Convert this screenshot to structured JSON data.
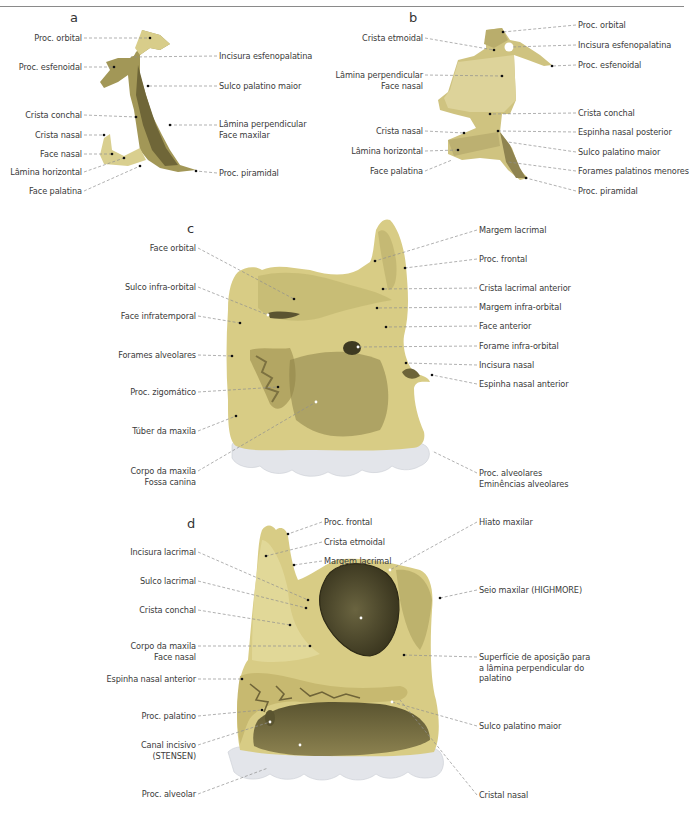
{
  "colors": {
    "bone_light": "#e6dc9a",
    "bone_mid": "#cfc27a",
    "bone_dark": "#8a7f45",
    "cavity": "#4f4a2e",
    "teeth": "#e4e6ea",
    "leader": "#8f8f8f",
    "text": "#3b3b3b"
  },
  "figures": [
    {
      "letter": "a",
      "labels_left": [
        {
          "text": "Proc. orbital",
          "x": 82,
          "y": 33
        },
        {
          "text": "Proc. esfenoidal",
          "x": 82,
          "y": 62
        },
        {
          "text": "Crista conchal",
          "x": 82,
          "y": 110
        },
        {
          "text": "Crista nasal",
          "x": 82,
          "y": 130
        },
        {
          "text": "Face nasal",
          "x": 82,
          "y": 149
        },
        {
          "text": "Lâmina horizontal",
          "x": 82,
          "y": 167
        },
        {
          "text": "Face palatina",
          "x": 82,
          "y": 186
        }
      ],
      "labels_right": [
        {
          "text": "Incisura esfenopalatina",
          "x": 219,
          "y": 51
        },
        {
          "text": "Sulco palatino maior",
          "x": 219,
          "y": 81
        },
        {
          "text": "Lâmina perpendicular\nFace maxilar",
          "x": 219,
          "y": 119
        },
        {
          "text": "Proc. piramidal",
          "x": 219,
          "y": 168
        }
      ]
    },
    {
      "letter": "b",
      "labels_left": [
        {
          "text": "Crista etmoidal",
          "x": 423,
          "y": 33
        },
        {
          "text": "Lâmina perpendicular\nFace nasal",
          "x": 423,
          "y": 70
        },
        {
          "text": "Crista nasal",
          "x": 423,
          "y": 126
        },
        {
          "text": "Lâmina horizontal",
          "x": 423,
          "y": 146
        },
        {
          "text": "Face palatina",
          "x": 423,
          "y": 166
        }
      ],
      "labels_right": [
        {
          "text": "Proc. orbital",
          "x": 578,
          "y": 20
        },
        {
          "text": "Incisura esfenopalatina",
          "x": 578,
          "y": 40
        },
        {
          "text": "Proc. esfenoidal",
          "x": 578,
          "y": 60
        },
        {
          "text": "Crista conchal",
          "x": 578,
          "y": 108
        },
        {
          "text": "Espinha nasal posterior",
          "x": 578,
          "y": 127
        },
        {
          "text": "Sulco palatino maior",
          "x": 578,
          "y": 147
        },
        {
          "text": "Forames palatinos menores",
          "x": 578,
          "y": 166
        },
        {
          "text": "Proc. piramidal",
          "x": 578,
          "y": 186
        }
      ]
    },
    {
      "letter": "c",
      "labels_left": [
        {
          "text": "Face orbital",
          "x": 196,
          "y": 243
        },
        {
          "text": "Sulco infra-orbital",
          "x": 196,
          "y": 282
        },
        {
          "text": "Face infratemporal",
          "x": 196,
          "y": 311
        },
        {
          "text": "Forames alveolares",
          "x": 196,
          "y": 350
        },
        {
          "text": "Proc. zigomático",
          "x": 196,
          "y": 387
        },
        {
          "text": "Túber da maxila",
          "x": 196,
          "y": 426
        },
        {
          "text": "Corpo da maxila\nFossa canina",
          "x": 196,
          "y": 466
        }
      ],
      "labels_right": [
        {
          "text": "Margem lacrimal",
          "x": 479,
          "y": 225
        },
        {
          "text": "Proc. frontal",
          "x": 479,
          "y": 254
        },
        {
          "text": "Crista lacrimal anterior",
          "x": 479,
          "y": 283
        },
        {
          "text": "Margem infra-orbital",
          "x": 479,
          "y": 302
        },
        {
          "text": "Face anterior",
          "x": 479,
          "y": 321
        },
        {
          "text": "Forame infra-orbital",
          "x": 479,
          "y": 341
        },
        {
          "text": "Incisura nasal",
          "x": 479,
          "y": 360
        },
        {
          "text": "Espinha nasal anterior",
          "x": 479,
          "y": 379
        },
        {
          "text": "Proc. alveolares\nEminências alveolares",
          "x": 479,
          "y": 468
        }
      ]
    },
    {
      "letter": "d",
      "labels_left": [
        {
          "text": "Incisura lacrimal",
          "x": 196,
          "y": 547
        },
        {
          "text": "Sulco lacrimal",
          "x": 196,
          "y": 576
        },
        {
          "text": "Crista conchal",
          "x": 196,
          "y": 605
        },
        {
          "text": "Corpo da maxila\nFace nasal",
          "x": 196,
          "y": 641
        },
        {
          "text": "Espinha nasal anterior",
          "x": 196,
          "y": 674
        },
        {
          "text": "Proc. palatino",
          "x": 196,
          "y": 711
        },
        {
          "text": "Canal incisivo\n(STENSEN)",
          "x": 196,
          "y": 740
        },
        {
          "text": "Proc. alveolar",
          "x": 196,
          "y": 789
        }
      ],
      "labels_right_top": [
        {
          "text": "Proc. frontal",
          "x": 324,
          "y": 517
        },
        {
          "text": "Crista etmoidal",
          "x": 324,
          "y": 537
        },
        {
          "text": "Margem lacrimal",
          "x": 324,
          "y": 556
        }
      ],
      "labels_right": [
        {
          "text": "Hiato maxilar",
          "x": 479,
          "y": 517
        },
        {
          "text": "Seio maxilar (HIGHMORE)",
          "x": 479,
          "y": 585
        },
        {
          "text": "Superfície de aposição para\na lâmina perpendicular do\npalatino",
          "x": 479,
          "y": 652
        },
        {
          "text": "Sulco palatino maior",
          "x": 479,
          "y": 721
        },
        {
          "text": "Cristal nasal",
          "x": 479,
          "y": 790
        }
      ]
    }
  ]
}
